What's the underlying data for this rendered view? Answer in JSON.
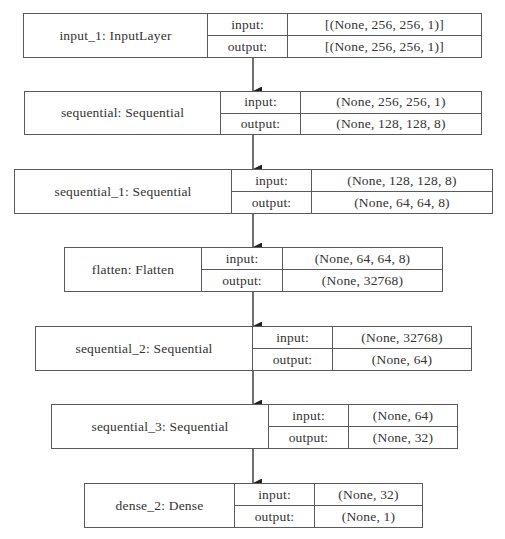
{
  "diagram": {
    "type": "keras-model-plot",
    "colors": {
      "border": "#5a5a5a",
      "text": "#333333",
      "background": "#ffffff",
      "arrow": "#222222"
    },
    "labels": {
      "input": "input:",
      "output": "output:"
    },
    "layers": [
      {
        "name": "input_1: InputLayer",
        "input": "[(None, 256, 256, 1)]",
        "output": "[(None, 256, 256, 1)]"
      },
      {
        "name": "sequential: Sequential",
        "input": "(None, 256, 256, 1)",
        "output": "(None, 128, 128, 8)"
      },
      {
        "name": "sequential_1: Sequential",
        "input": "(None, 128, 128, 8)",
        "output": "(None, 64, 64, 8)"
      },
      {
        "name": "flatten: Flatten",
        "input": "(None, 64, 64, 8)",
        "output": "(None, 32768)"
      },
      {
        "name": "sequential_2: Sequential",
        "input": "(None, 32768)",
        "output": "(None, 64)"
      },
      {
        "name": "sequential_3: Sequential",
        "input": "(None, 64)",
        "output": "(None, 32)"
      },
      {
        "name": "dense_2: Dense",
        "input": "(None, 32)",
        "output": "(None, 1)"
      }
    ],
    "edges": [
      {
        "from": "input_1",
        "to": "sequential"
      },
      {
        "from": "sequential",
        "to": "sequential_1"
      },
      {
        "from": "sequential_1",
        "to": "flatten"
      },
      {
        "from": "flatten",
        "to": "sequential_2"
      },
      {
        "from": "sequential_2",
        "to": "sequential_3"
      },
      {
        "from": "sequential_3",
        "to": "dense_2"
      }
    ]
  }
}
